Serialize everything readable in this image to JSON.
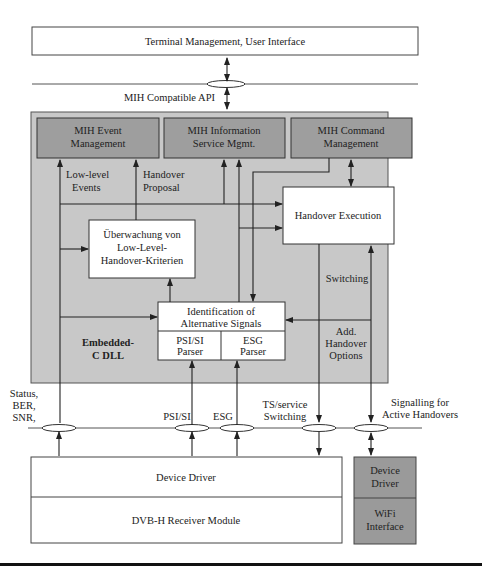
{
  "diagram": {
    "colors": {
      "dll_background": "#c8c8c8",
      "mih_box": "#9e9e9e",
      "wifi_box": "#9a9a9a",
      "white_box": "#ffffff",
      "line": "#222222"
    },
    "top_box": {
      "label": "Terminal Management, User Interface"
    },
    "api_label": "MIH Compatible API",
    "mih_boxes": [
      {
        "line1": "MIH Event",
        "line2": "Management"
      },
      {
        "line1": "MIH Information",
        "line2": "Service Mgmt."
      },
      {
        "line1": "MIH Command",
        "line2": "Management"
      }
    ],
    "labels": {
      "low_level_1": "Low-level",
      "low_level_2": "Events",
      "handover_proposal_1": "Handover",
      "handover_proposal_2": "Proposal",
      "switching": "Switching",
      "add_options_1": "Add.",
      "add_options_2": "Handover",
      "add_options_3": "Options",
      "dll_1": "Embedded-",
      "dll_2": "C DLL",
      "status_1": "Status,",
      "status_2": "BER,",
      "status_3": "SNR,",
      "psisi": "PSI/SI",
      "esg": "ESG",
      "ts_1": "TS/service",
      "ts_2": "Switching",
      "signalling_1": "Signalling for",
      "signalling_2": "Active Handovers"
    },
    "handover_execution": {
      "label": "Handover Execution"
    },
    "ueberwachung": {
      "line1": "Überwachung von",
      "line2": "Low-Level-",
      "line3": "Handover-Kriterien"
    },
    "identification": {
      "line1": "Identification of",
      "line2": "Alternative Signals",
      "parser_left_1": "PSI/SI",
      "parser_left_2": "Parser",
      "parser_right_1": "ESG",
      "parser_right_2": "Parser"
    },
    "driver_stack": {
      "device_driver": "Device Driver",
      "receiver": "DVB-H Receiver Module"
    },
    "wifi_stack": {
      "driver_1": "Device",
      "driver_2": "Driver",
      "wifi_1": "WiFi",
      "wifi_2": "Interface"
    }
  }
}
